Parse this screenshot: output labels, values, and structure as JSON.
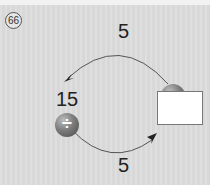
{
  "question": {
    "number": "66",
    "badge": "⑯"
  },
  "diagram": {
    "start_value": "15",
    "top_operand": "5",
    "bottom_operand": "5",
    "top_operator": {
      "symbol": "×",
      "icon": "multiply-icon"
    },
    "bottom_operator": {
      "symbol": "÷",
      "icon": "divide-icon"
    },
    "answer": ""
  }
}
